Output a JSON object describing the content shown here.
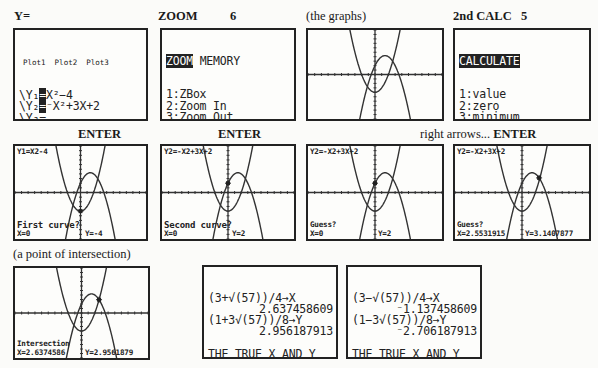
{
  "labels": {
    "y_equals": "Y=",
    "zoom": "ZOOM",
    "zoom_key": "6",
    "the_graphs": "(the graphs)",
    "calc": "2nd CALC",
    "calc_key": "5",
    "enter1": "ENTER",
    "enter2": "ENTER",
    "right_arrows": "right arrows...",
    "right_arrows_enter": "ENTER",
    "point_of_intersection": "(a point of intersection)"
  },
  "y_editor": {
    "plots": "Plot1  Plot2  Plot3",
    "lines": [
      {
        "prefix": "\\Y₁",
        "sel": "=",
        "expr": "X²−4"
      },
      {
        "prefix": "\\Y₂",
        "sel": "=",
        "expr": "⁻X²+3X+2"
      },
      {
        "prefix": "\\Y₃",
        "sel": "",
        "expr": "="
      },
      {
        "prefix": "\\Y₄",
        "sel": "",
        "expr": "="
      },
      {
        "prefix": "\\Y₅",
        "sel": "",
        "expr": "="
      },
      {
        "prefix": "\\Y₆",
        "sel": "",
        "expr": "="
      },
      {
        "prefix": "\\Y₇",
        "sel": "",
        "expr": "="
      }
    ]
  },
  "zoom_menu": {
    "tab": "ZOOM",
    "tab2": "MEMORY",
    "items": [
      {
        "key": "1:",
        "label": "ZBox"
      },
      {
        "key": "2:",
        "label": "Zoom In"
      },
      {
        "key": "3:",
        "label": "Zoom Out"
      },
      {
        "key": "4:",
        "label": "ZDecimal"
      },
      {
        "key": "5:",
        "label": "ZSquare"
      },
      {
        "key": "6:",
        "label": "ZStandard",
        "selected": true
      },
      {
        "key": "7↓",
        "label": "ZTrig"
      }
    ]
  },
  "calc_menu": {
    "title": "CALCULATE",
    "items": [
      {
        "key": "1:",
        "label": "value"
      },
      {
        "key": "2:",
        "label": "zero"
      },
      {
        "key": "3:",
        "label": "minimum"
      },
      {
        "key": "4:",
        "label": "maximum"
      },
      {
        "key": "5:",
        "label": "intersect",
        "selected": true
      },
      {
        "key": "6:",
        "label": "dy/dx"
      },
      {
        "key": "7:",
        "label": "∫f(x)dx"
      }
    ]
  },
  "graphs": {
    "window": {
      "xmin": -10,
      "xmax": 10,
      "ymin": -10,
      "ymax": 10
    },
    "functions": [
      "x^2-4",
      "-x^2+3x+2"
    ],
    "first_curve": {
      "header": "Y1=X2-4",
      "prompt": "First curve?",
      "x": "X=0",
      "y": "Y=-4"
    },
    "second_curve": {
      "header": "Y2=-X2+3X+2",
      "prompt": "Second curve?",
      "x": "X=0",
      "y": "Y=2"
    },
    "guess1": {
      "header": "Y2=-X2+3X+2",
      "prompt": "Guess?",
      "x": "X=0",
      "y": "Y=2"
    },
    "guess2": {
      "header": "Y2=-X2+3X+2",
      "prompt": "Guess?",
      "x": "X=2.5531915",
      "y": "Y=3.1407877"
    },
    "intersection": {
      "prompt": "Intersection",
      "x": "X=2.6374586",
      "y": "Y=2.9561879"
    }
  },
  "home_screen_1": {
    "lines": [
      {
        "text": "(3+√(57))/4→X",
        "align": "left"
      },
      {
        "text": "2.637458609",
        "align": "right"
      },
      {
        "text": "(1+3√(57))/8→Y",
        "align": "left"
      },
      {
        "text": "2.956187913",
        "align": "right"
      },
      {
        "text": "",
        "align": "left"
      },
      {
        "text": "THE TRUE X AND Y",
        "align": "left"
      },
      {
        "text": "VALUES FOR THIS",
        "align": "left"
      },
      {
        "text": "POINT.",
        "align": "left"
      }
    ]
  },
  "home_screen_2": {
    "lines": [
      {
        "text": "(3−√(57))/4→X",
        "align": "left"
      },
      {
        "text": "⁻1.137458609",
        "align": "right"
      },
      {
        "text": "(1−3√(57))/8→Y",
        "align": "left"
      },
      {
        "text": "⁻2.706187913",
        "align": "right"
      },
      {
        "text": "",
        "align": "left"
      },
      {
        "text": "THE TRUE X AND Y",
        "align": "left"
      },
      {
        "text": "VALUES FOR THE",
        "align": "left"
      },
      {
        "text": "OTHER POINT.",
        "align": "left"
      }
    ]
  }
}
